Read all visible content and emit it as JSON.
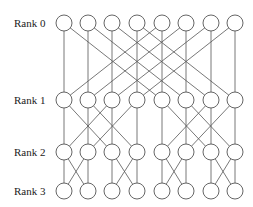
{
  "diagram": {
    "type": "butterfly-network",
    "colors": {
      "line": "#555555",
      "node_stroke": "#555555",
      "node_fill": "#ffffff",
      "text": "#222222"
    },
    "columns_x": [
      64,
      88,
      112,
      137,
      162,
      186,
      211,
      235
    ],
    "node_radius": 8,
    "ranks": [
      {
        "label": "Rank 0",
        "y": 23
      },
      {
        "label": "Rank 1",
        "y": 100
      },
      {
        "label": "Rank 2",
        "y": 152
      },
      {
        "label": "Rank 3",
        "y": 191
      }
    ],
    "stages": [
      {
        "from_rank": 0,
        "to_rank": 1,
        "stride": 4
      },
      {
        "from_rank": 1,
        "to_rank": 2,
        "stride": 2
      },
      {
        "from_rank": 2,
        "to_rank": 3,
        "stride": 1
      }
    ]
  }
}
